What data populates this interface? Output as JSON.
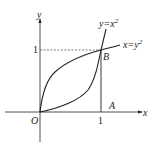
{
  "diagram": {
    "axes": {
      "x_label": "x",
      "y_label": "y",
      "origin_label": "O"
    },
    "ticks": {
      "x_one": "1",
      "y_one": "1"
    },
    "points": {
      "A": "A",
      "B": "B"
    },
    "curves": [
      {
        "name": "parabola-up",
        "label": "y=x",
        "sup": "2"
      },
      {
        "name": "parabola-right",
        "label": "x=y",
        "sup": "2"
      }
    ],
    "colors": {
      "stroke": "#222222",
      "dashed": "#444444"
    }
  }
}
